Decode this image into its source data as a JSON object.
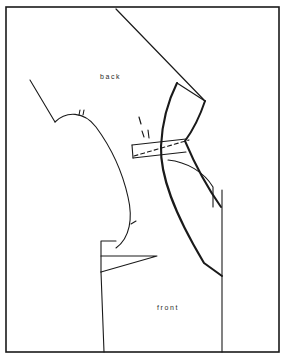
{
  "figure": {
    "name": "garment-pattern-draft",
    "kind": "sewing-pattern-technical-drawing",
    "background_color": "#ffffff",
    "ink_color": "#1a1a1a",
    "border": {
      "name": "figure-frame",
      "x": 6,
      "y": 7,
      "width": 273,
      "height": 345,
      "stroke_width": 1.6,
      "color": "#1a1a1a"
    }
  },
  "labels": {
    "back": "back",
    "front": "front"
  },
  "label_positions": {
    "back": {
      "x": 100,
      "y": 79
    },
    "front": {
      "x": 157,
      "y": 310
    }
  },
  "chart_data": {
    "type": "diagram",
    "title": "",
    "paths": [
      {
        "name": "upper-diagonal-shoulder-line",
        "kind": "solid-thin",
        "stroke_width": 1.2,
        "d": "M 116 9 L 205 101"
      },
      {
        "name": "back-neck-shoulder-line",
        "kind": "solid-thin",
        "stroke_width": 1.1,
        "d": "M 30 80 L 55 122"
      },
      {
        "name": "back-armhole-curve",
        "kind": "solid-thin",
        "stroke_width": 1.1,
        "d": "M 55 122 C 66 111, 84 111, 96 127 C 110 146, 122 170, 128 197 C 133 218, 130 238, 116 248"
      },
      {
        "name": "armhole-notch-tick-1",
        "kind": "solid-thin",
        "stroke_width": 1.1,
        "d": "M 79 115 L 80 110"
      },
      {
        "name": "armhole-notch-tick-2",
        "kind": "solid-thin",
        "stroke_width": 1.1,
        "d": "M 83 115 L 84 110"
      },
      {
        "name": "armhole-notch-tick-3",
        "kind": "solid-thin",
        "stroke_width": 1.1,
        "d": "M 131 224 L 136 221"
      },
      {
        "name": "waist-step-notch",
        "kind": "solid-thin",
        "stroke_width": 1.1,
        "d": "M 101 272 L 101 241 L 116 241"
      },
      {
        "name": "waist-dart-wedge",
        "kind": "solid-thin",
        "stroke_width": 1.1,
        "d": "M 101 256 L 157 256 L 101 272"
      },
      {
        "name": "back-side-seam-lower",
        "kind": "solid-thin",
        "stroke_width": 1.1,
        "d": "M 101 272 L 104 352"
      },
      {
        "name": "shoulder-box-top",
        "kind": "solid-thin",
        "stroke_width": 1.1,
        "d": "M 132 145 L 186 139"
      },
      {
        "name": "shoulder-box-left",
        "kind": "solid-thin",
        "stroke_width": 1.1,
        "d": "M 132 145 L 133 158"
      },
      {
        "name": "shoulder-box-bottom",
        "kind": "solid-thin",
        "stroke_width": 1.1,
        "d": "M 133 158 L 186 152"
      },
      {
        "name": "shoulder-overlay-dashed",
        "kind": "dashed",
        "stroke_width": 1.1,
        "dash": "4 3",
        "d": "M 134 156 L 189 140"
      },
      {
        "name": "front-shoulder-thick-curve",
        "kind": "solid-thick",
        "stroke_width": 2.1,
        "d": "M 177 83 C 168 101, 162 124, 161 146 C 160 176, 174 213, 204 263 L 222 276"
      },
      {
        "name": "front-shoulder-point-line",
        "kind": "solid-thin",
        "stroke_width": 1.2,
        "d": "M 177 83 L 205 101"
      },
      {
        "name": "front-neck-thick-curve",
        "kind": "solid-thick",
        "stroke_width": 2.0,
        "d": "M 205 101 C 200 116, 193 130, 185 141 C 196 167, 209 190, 221 207"
      },
      {
        "name": "front-underarm-curve",
        "kind": "solid-thin",
        "stroke_width": 1.1,
        "d": "M 168 160 C 187 162, 204 172, 213 187 L 213 207"
      },
      {
        "name": "front-side-seam-vertical",
        "kind": "solid-thin",
        "stroke_width": 1.1,
        "d": "M 222 190 L 222 352"
      },
      {
        "name": "arrow-mark-head",
        "kind": "solid-thin",
        "stroke_width": 1.2,
        "d": "M 139 117 L 141 124"
      },
      {
        "name": "arrow-mark-tail-1",
        "kind": "solid-thin",
        "stroke_width": 1.1,
        "d": "M 142 131 L 144 137"
      },
      {
        "name": "arrow-mark-tail-2",
        "kind": "solid-thin",
        "stroke_width": 1.1,
        "d": "M 148 130 L 149 138"
      }
    ]
  }
}
